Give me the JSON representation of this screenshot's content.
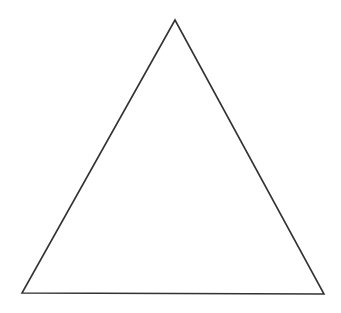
{
  "diagram": {
    "shape": "triangle",
    "type": "equilateral",
    "stroke_color": "#333333",
    "fill_color": "#ffffff",
    "background": "#ffffff",
    "vertices": {
      "apex": [
        175,
        20
      ],
      "bottom_left": [
        22,
        293
      ],
      "bottom_right": [
        324,
        294
      ]
    }
  }
}
